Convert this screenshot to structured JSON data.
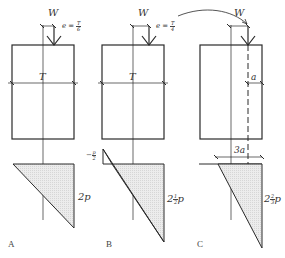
{
  "figure": {
    "panels": [
      {
        "id": "A",
        "letter": "A",
        "load_label": "W",
        "eccentricity_label": "e =",
        "eccentricity_num": "T",
        "eccentricity_den": "6",
        "width_label": "T",
        "pressure_max_label": "2p",
        "pressure_min_label": ""
      },
      {
        "id": "B",
        "letter": "B",
        "load_label": "W",
        "eccentricity_label": "e =",
        "eccentricity_num": "T",
        "eccentricity_den": "4",
        "width_label": "T",
        "pressure_max_label_whole": "2",
        "pressure_max_label_num": "1",
        "pressure_max_label_den": "2",
        "pressure_max_label_suffix": "p",
        "pressure_min_label_sign": "−",
        "pressure_min_label_num": "p",
        "pressure_min_label_den": "2"
      },
      {
        "id": "C",
        "letter": "C",
        "load_label": "W",
        "edge_distance_label": "a",
        "bearing_width_label": "3a",
        "pressure_max_label_whole": "2",
        "pressure_max_label_num": "2",
        "pressure_max_label_den": "3",
        "pressure_max_label_suffix": "p"
      }
    ],
    "colors": {
      "line": "#2a2a2a",
      "hatch_fill": "#e4e4e4",
      "text": "#333333"
    }
  }
}
